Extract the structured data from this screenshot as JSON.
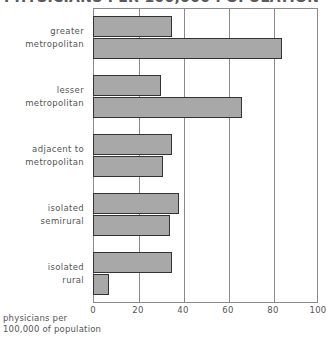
{
  "title": {
    "text": "PHYSICIANS PER 100,000 POPULATION",
    "cropped": true
  },
  "axis_caption": {
    "line1": "physicians per",
    "line2": "100,000 of population"
  },
  "x_ticks": [
    "0",
    "20",
    "40",
    "60",
    "80",
    "100"
  ],
  "colors": {
    "bar_fill": "#a8a8a8",
    "bar_border": "#333333",
    "grid": "#8a8a8a",
    "text": "#555555",
    "background": "#ffffff"
  },
  "chart_data": {
    "type": "bar",
    "orientation": "horizontal",
    "grouped": true,
    "title": "PHYSICIANS PER 100,000 POPULATION",
    "xlabel": "physicians per 100,000 of population",
    "ylabel": "",
    "xlim": [
      0,
      100
    ],
    "xticks": [
      0,
      20,
      40,
      60,
      80,
      100
    ],
    "grid": true,
    "legend": "none",
    "categories": [
      "greater metropolitan",
      "lesser metropolitan",
      "adjacent to metropolitan",
      "isolated semirural",
      "isolated rural"
    ],
    "category_lines": [
      [
        "greater",
        "metropolitan"
      ],
      [
        "lesser",
        "metropolitan"
      ],
      [
        "adjacent to",
        "metropolitan"
      ],
      [
        "isolated",
        "semirural"
      ],
      [
        "isolated",
        "rural"
      ]
    ],
    "series": [
      {
        "name": "series-1",
        "values": [
          35,
          30,
          35,
          38,
          35
        ]
      },
      {
        "name": "series-2",
        "values": [
          84,
          66,
          31,
          34,
          7
        ]
      }
    ]
  }
}
